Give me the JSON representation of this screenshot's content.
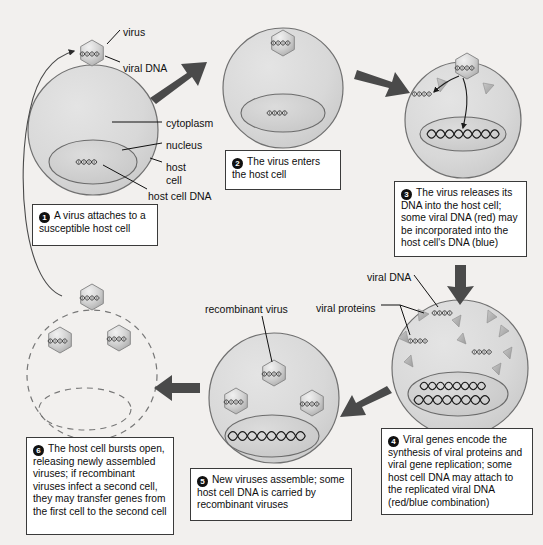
{
  "diagram": {
    "background_color": "#f2f0ee",
    "cell_fill": "#d9d9d9",
    "nucleus_fill": "#cfcfcf",
    "outline_color": "#6e6e6e",
    "arrow_color": "#4a4a4a",
    "callout_border": "#3a3a3a"
  },
  "labels": [
    {
      "id": "virus",
      "text": "virus",
      "x": 123,
      "y": 26
    },
    {
      "id": "viral-dna",
      "text": "viral DNA",
      "x": 123,
      "y": 62
    },
    {
      "id": "cytoplasm",
      "text": "cytoplasm",
      "x": 166,
      "y": 117
    },
    {
      "id": "nucleus",
      "text": "nucleus",
      "x": 166,
      "y": 139
    },
    {
      "id": "host-cell-1",
      "text": "host",
      "x": 166,
      "y": 161
    },
    {
      "id": "host-cell-2",
      "text": "cell",
      "x": 166,
      "y": 174
    },
    {
      "id": "host-cell-dna",
      "text": "host cell DNA",
      "x": 148,
      "y": 190
    },
    {
      "id": "recombinant-virus",
      "text": "recombinant virus",
      "x": 205,
      "y": 303
    },
    {
      "id": "viral-dna-2",
      "text": "viral DNA",
      "x": 367,
      "y": 271
    },
    {
      "id": "viral-proteins",
      "text": "viral proteins",
      "x": 316,
      "y": 302
    }
  ],
  "callouts": [
    {
      "id": "step-1",
      "number": "1",
      "text": "A virus attaches to a susceptible host cell",
      "x": 32,
      "y": 204,
      "w": 126,
      "h": 42
    },
    {
      "id": "step-2",
      "number": "2",
      "text": "The virus enters the host cell",
      "x": 225,
      "y": 150,
      "w": 116,
      "h": 40
    },
    {
      "id": "step-3",
      "number": "3",
      "text": "The virus releases its DNA into the host cell; some viral DNA (red) may be incorporated into the host cell's DNA (blue)",
      "x": 394,
      "y": 181,
      "w": 133,
      "h": 76
    },
    {
      "id": "step-4",
      "number": "4",
      "text": "Viral genes encode the synthesis of viral proteins and viral gene replication; some host cell DNA may attach to the replicated viral DNA (red/blue combination)",
      "x": 381,
      "y": 428,
      "w": 152,
      "h": 87
    },
    {
      "id": "step-5",
      "number": "5",
      "text": "New viruses assemble; some host cell DNA is carried by recombinant viruses",
      "x": 190,
      "y": 468,
      "w": 162,
      "h": 53
    },
    {
      "id": "step-6",
      "number": "6",
      "text": "The host cell bursts open, releasing newly assembled viruses; if recombinant viruses infect a second cell, they may transfer genes from the first cell to the second cell",
      "x": 26,
      "y": 437,
      "w": 148,
      "h": 98
    }
  ],
  "cells": [
    {
      "id": "cell-step-1",
      "cx": 93,
      "cy": 130,
      "r": 65,
      "dashed": false
    },
    {
      "id": "cell-step-2",
      "cx": 283,
      "cy": 88,
      "r": 60,
      "dashed": false
    },
    {
      "id": "cell-step-3",
      "cx": 463,
      "cy": 120,
      "r": 58,
      "dashed": false
    },
    {
      "id": "cell-step-4",
      "cx": 460,
      "cy": 368,
      "r": 68,
      "dashed": false
    },
    {
      "id": "cell-step-5",
      "cx": 274,
      "cy": 398,
      "r": 65,
      "dashed": false
    },
    {
      "id": "cell-step-6",
      "cx": 92,
      "cy": 375,
      "r": 65,
      "dashed": true
    }
  ],
  "viruses": [
    {
      "id": "virus-attaching",
      "cx": 92,
      "cy": 53
    },
    {
      "id": "virus-in-cell-2",
      "cx": 283,
      "cy": 43
    },
    {
      "id": "virus-in-cell-3",
      "cx": 467,
      "cy": 66
    },
    {
      "id": "virus-recombinant-top",
      "cx": 274,
      "cy": 373
    },
    {
      "id": "virus-recombinant-left",
      "cx": 236,
      "cy": 401
    },
    {
      "id": "virus-recombinant-right",
      "cx": 312,
      "cy": 403
    },
    {
      "id": "virus-released-top",
      "cx": 92,
      "cy": 297
    },
    {
      "id": "virus-released-left",
      "cx": 60,
      "cy": 340
    },
    {
      "id": "virus-released-right",
      "cx": 119,
      "cy": 338
    }
  ],
  "arrows": [
    {
      "id": "arrow-1-to-2",
      "from": "step-1",
      "to": "step-2"
    },
    {
      "id": "arrow-2-to-3",
      "from": "step-2",
      "to": "step-3"
    },
    {
      "id": "arrow-3-to-4",
      "from": "step-3",
      "to": "step-4"
    },
    {
      "id": "arrow-4-to-5",
      "from": "step-4",
      "to": "step-5"
    },
    {
      "id": "arrow-5-to-6",
      "from": "step-5",
      "to": "step-6"
    },
    {
      "id": "arrow-6-to-1",
      "from": "step-6",
      "to": "step-1",
      "style": "thin-curved"
    }
  ]
}
